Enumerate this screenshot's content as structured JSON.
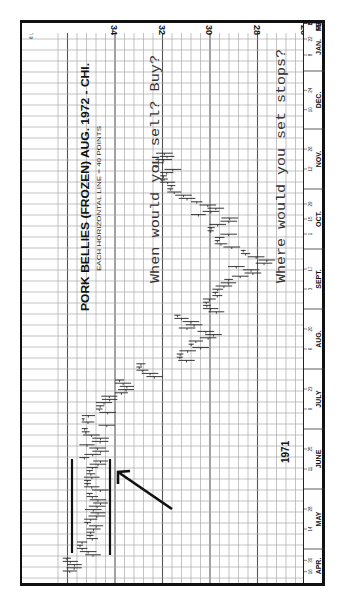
{
  "chart_data": {
    "type": "bar",
    "subtype": "OHLC daily bar chart (rotated 90° clockwise: time runs bottom→top, price decreases left→right)",
    "title": "PORK BELLIES (FROZEN) AUG. 1972 - CHI.",
    "subtitle": "EACH HORIZONTAL LINE = 40 POINTS",
    "unit_label": "¢ LB.",
    "year_marker": "1971",
    "price_axis": {
      "label": "cents per lb.",
      "ticks": [
        34,
        32,
        30,
        28,
        26
      ],
      "range": [
        36.4,
        25.8
      ],
      "minor_step": 0.4
    },
    "date_axis": {
      "months": [
        {
          "label": "APR.",
          "days": [
            "16",
            "30"
          ]
        },
        {
          "label": "MAY",
          "days": [
            "14",
            "28"
          ]
        },
        {
          "label": "JUNE",
          "days": [
            "11",
            "25"
          ]
        },
        {
          "label": "JULY",
          "days": [
            "9",
            "23"
          ]
        },
        {
          "label": "AUG.",
          "days": [
            "6",
            "20"
          ]
        },
        {
          "label": "SEPT.",
          "days": [
            "3",
            "17"
          ]
        },
        {
          "label": "OCT.",
          "days": [
            "1",
            "15",
            "29"
          ]
        },
        {
          "label": "NOV.",
          "days": [
            "12",
            "26"
          ]
        },
        {
          "label": "DEC.",
          "days": [
            "10",
            "24"
          ]
        },
        {
          "label": "JAN.",
          "days": [
            "8",
            "22"
          ]
        },
        {
          "label": "FEB.",
          "days": [
            "5",
            "19"
          ]
        },
        {
          "label": "MAR",
          "days": [
            "5",
            "19"
          ]
        }
      ]
    },
    "series": [
      {
        "name": "Approximate weekly price range (¢/lb)",
        "x": [
          "Apr 9",
          "Apr 16",
          "Apr 23",
          "Apr 30",
          "May 7",
          "May 14",
          "May 21",
          "May 28",
          "Jun 4",
          "Jun 11",
          "Jun 18",
          "Jun 25",
          "Jul 2",
          "Jul 9",
          "Jul 16",
          "Jul 23",
          "Jul 30",
          "Aug 6",
          "Aug 13",
          "Aug 20",
          "Aug 27",
          "Sep 3",
          "Sep 10",
          "Sep 17",
          "Sep 24",
          "Oct 1"
        ],
        "high": [
          36.2,
          35.6,
          35.2,
          35.3,
          35.2,
          35.3,
          35.2,
          35.5,
          35.4,
          35.4,
          34.8,
          34.0,
          33.1,
          31.4,
          30.9,
          31.5,
          30.3,
          29.9,
          29.4,
          28.7,
          29.8,
          30.1,
          30.8,
          31.8,
          32.1,
          32.4
        ],
        "low": [
          35.4,
          34.6,
          34.5,
          34.4,
          34.3,
          34.2,
          34.3,
          34.2,
          34.2,
          33.1,
          33.9,
          33.2,
          32.0,
          29.8,
          29.4,
          30.3,
          29.4,
          28.9,
          27.6,
          27.1,
          28.4,
          28.7,
          29.3,
          30.6,
          31.2,
          31.5
        ]
      }
    ],
    "annotations": [
      {
        "type": "channel-line",
        "price": 34.9,
        "from": "Apr 16",
        "to": "Jun 25"
      },
      {
        "type": "channel-line",
        "price": 33.2,
        "from": "Apr 16",
        "to": "Jun 25"
      },
      {
        "type": "arrow",
        "points_to": "Jun 20 breakout below 33.2"
      }
    ],
    "grid": true
  },
  "questions": {
    "q1": "When would you sell? Buy?",
    "q2": "Where would you set stops?"
  }
}
